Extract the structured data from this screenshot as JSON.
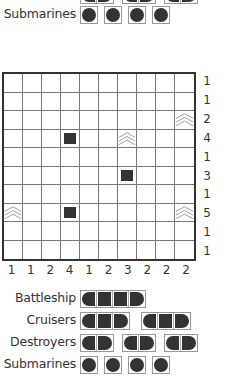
{
  "puzzle": {
    "rows": 10,
    "cols": 10,
    "row_clues": [
      1,
      1,
      2,
      4,
      1,
      3,
      1,
      5,
      1,
      1
    ],
    "col_clues": [
      1,
      1,
      2,
      4,
      1,
      2,
      3,
      2,
      2,
      2
    ],
    "given_cells": [
      {
        "row": 2,
        "col": 9,
        "type": "water"
      },
      {
        "row": 3,
        "col": 3,
        "type": "ship-middle"
      },
      {
        "row": 3,
        "col": 6,
        "type": "water"
      },
      {
        "row": 5,
        "col": 6,
        "type": "ship-middle"
      },
      {
        "row": 7,
        "col": 0,
        "type": "water"
      },
      {
        "row": 7,
        "col": 3,
        "type": "ship-middle"
      },
      {
        "row": 7,
        "col": 9,
        "type": "water"
      }
    ]
  },
  "top_fleet": {
    "submarines_label": "Submarines",
    "submarines_count": 4
  },
  "fleet": {
    "battleship": {
      "label": "Battleship",
      "count": 1,
      "length": 4
    },
    "cruisers": {
      "label": "Cruisers",
      "count": 2,
      "length": 3
    },
    "destroyers": {
      "label": "Destroyers",
      "count": 3,
      "length": 2
    },
    "submarines": {
      "label": "Submarines",
      "count": 4,
      "length": 1
    }
  },
  "colors": {
    "ink": "#333333",
    "grid_line": "#777777",
    "water": "#999999",
    "background": "#ffffff"
  }
}
